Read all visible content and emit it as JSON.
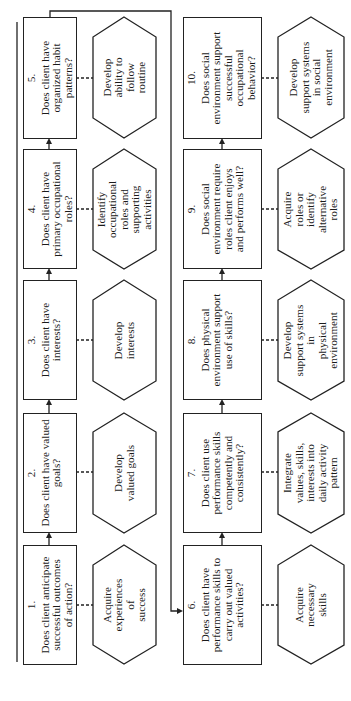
{
  "diagram": {
    "orientation": "rotated-90-ccw",
    "questions": [
      {
        "id": 1,
        "number": "1.",
        "text": "Does client anticipate successful outcomes of action?",
        "lines": [
          "Does client anticipate",
          "successful outcomes",
          "of action?"
        ]
      },
      {
        "id": 2,
        "number": "2.",
        "text": "Does client have valued goals?",
        "lines": [
          "Does client have valued",
          "goals?"
        ]
      },
      {
        "id": 3,
        "number": "3.",
        "text": "Does client have interests?",
        "lines": [
          "Does client have",
          "interests?"
        ]
      },
      {
        "id": 4,
        "number": "4.",
        "text": "Does client have primary occupational roles?",
        "lines": [
          "Does client have",
          "primary occupational",
          "roles?"
        ]
      },
      {
        "id": 5,
        "number": "5.",
        "text": "Does client have organized habit patterns?",
        "lines": [
          "Does client have",
          "organized habit",
          "patterns?"
        ]
      },
      {
        "id": 6,
        "number": "6.",
        "text": "Does client have performance skills to carry out valued activities?",
        "lines": [
          "Does client have",
          "performance skills to",
          "carry out valued",
          "activities?"
        ]
      },
      {
        "id": 7,
        "number": "7.",
        "text": "Does client use performance skills competently and consistently?",
        "lines": [
          "Does client use",
          "performance skills",
          "competently and",
          "consistently?"
        ]
      },
      {
        "id": 8,
        "number": "8.",
        "text": "Does physical environment support use of skills?",
        "lines": [
          "Does physical",
          "environment support",
          "use of skills?"
        ]
      },
      {
        "id": 9,
        "number": "9.",
        "text": "Does social environment require roles client enjoys and performs well?",
        "lines": [
          "Does social",
          "environment require",
          "roles client enjoys",
          "and performs well?"
        ]
      },
      {
        "id": 10,
        "number": "10.",
        "text": "Does social environment support successful occupational behavior?",
        "lines": [
          "Does social",
          "environment support",
          "successful",
          "occupational",
          "behavior?"
        ]
      }
    ],
    "actions": [
      {
        "for": 1,
        "text": "Acquire experiences of success",
        "lines": [
          "Acquire",
          "experiences",
          "of",
          "success"
        ]
      },
      {
        "for": 2,
        "text": "Develop valued goals",
        "lines": [
          "Develop",
          "valued goals"
        ]
      },
      {
        "for": 3,
        "text": "Develop interests",
        "lines": [
          "Develop",
          "interests"
        ]
      },
      {
        "for": 4,
        "text": "Identify occupational roles and supporting activities",
        "lines": [
          "Identify",
          "occupational",
          "roles and",
          "supporting",
          "activities"
        ]
      },
      {
        "for": 5,
        "text": "Develop ability to follow routine",
        "lines": [
          "Develop",
          "ability to",
          "follow",
          "routine"
        ]
      },
      {
        "for": 6,
        "text": "Acquire necessary skills",
        "lines": [
          "Acquire",
          "necessary",
          "skills"
        ]
      },
      {
        "for": 7,
        "text": "Integrate values, skills, interests into daily activity pattern",
        "lines": [
          "Integrate",
          "values, skills,",
          "interests into",
          "daily activity",
          "pattern"
        ]
      },
      {
        "for": 8,
        "text": "Develop support systems in physical environment",
        "lines": [
          "Develop",
          "support systems in",
          "physical",
          "environment"
        ]
      },
      {
        "for": 9,
        "text": "Acquire roles or identify alternative roles",
        "lines": [
          "Acquire",
          "roles or",
          "identify alternative",
          "roles"
        ]
      },
      {
        "for": 10,
        "text": "Develop support systems in social environment",
        "lines": [
          "Develop",
          "support systems",
          "in social",
          "environment"
        ]
      }
    ],
    "flow": [
      {
        "from": 1,
        "to": 2
      },
      {
        "from": 2,
        "to": 3
      },
      {
        "from": 3,
        "to": 4
      },
      {
        "from": 4,
        "to": 5
      },
      {
        "from": 5,
        "to": 6
      },
      {
        "from": 6,
        "to": 7
      },
      {
        "from": 7,
        "to": 8
      },
      {
        "from": 8,
        "to": 9
      },
      {
        "from": 9,
        "to": 10
      }
    ],
    "colors": {
      "line": "#222222",
      "background": "#ffffff",
      "text": "#1a1a1a"
    }
  }
}
